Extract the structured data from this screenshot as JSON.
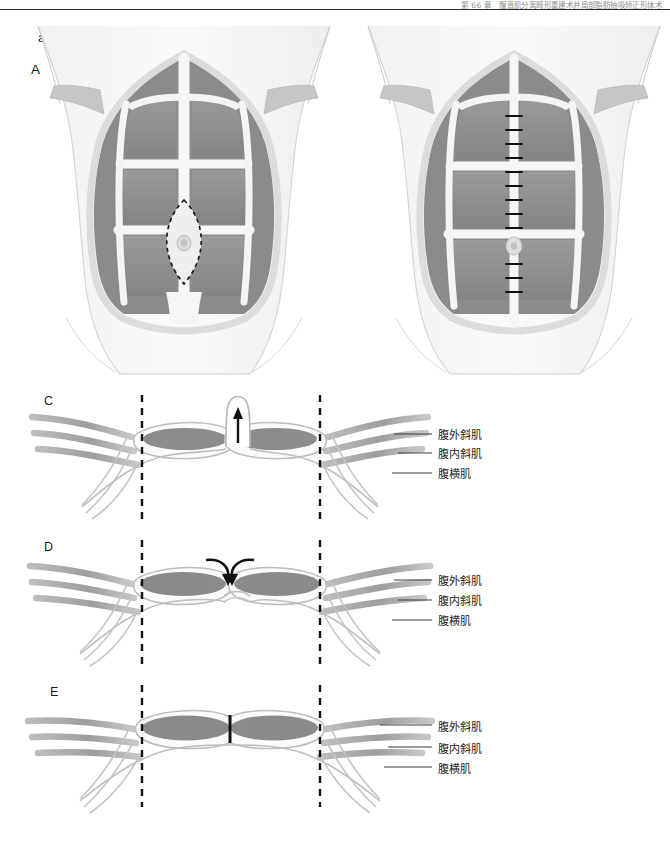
{
  "page": {
    "running_head": "第 66 章　腹直肌分离畸形重建术并局部脂肪抽吸矫正形体术",
    "width": 670,
    "height": 845
  },
  "figure": {
    "figure_label": "a",
    "panels": [
      {
        "id": "A",
        "label": "A",
        "view": "anterior-abdominal-wall",
        "caption_role": "diastasis-recti-before-repair",
        "features": [
          "rectus-abdominis",
          "linea-alba",
          "tendinous-intersections",
          "umbilicus",
          "dashed-defect-outline",
          "costal-margin",
          "iliac-crest"
        ]
      },
      {
        "id": "B",
        "label": "B",
        "view": "anterior-abdominal-wall",
        "caption_role": "midline-plication-sutures-after-repair",
        "features": [
          "rectus-abdominis",
          "linea-alba",
          "suture-line",
          "umbilicus",
          "costal-margin",
          "iliac-crest"
        ]
      },
      {
        "id": "C",
        "label": "C",
        "view": "axial-cross-section",
        "caption_role": "pre-repair-midline-bulge",
        "features": [
          "rectus-abdominis",
          "bulge",
          "up-arrow",
          "dashed-semilunar-lines"
        ]
      },
      {
        "id": "D",
        "label": "D",
        "view": "axial-cross-section",
        "caption_role": "medial-advancement-of-rectus-muscles",
        "features": [
          "rectus-abdominis",
          "curved-arrows",
          "dashed-semilunar-lines"
        ]
      },
      {
        "id": "E",
        "label": "E",
        "view": "axial-cross-section",
        "caption_role": "post-repair-approximated-midline",
        "features": [
          "rectus-abdominis",
          "midline-plication",
          "dashed-semilunar-lines"
        ]
      }
    ],
    "muscle_layer_labels": [
      {
        "text": "腹外斜肌",
        "meaning": "external-oblique"
      },
      {
        "text": "腹内斜肌",
        "meaning": "internal-oblique"
      },
      {
        "text": "腹横肌",
        "meaning": "transversus-abdominis"
      }
    ],
    "colors": {
      "muscle_fill": "#8e8e8e",
      "muscle_fill_dark": "#7c7c7c",
      "fascia": "#d8d8d8",
      "skin_outline": "#c9c9c9",
      "dashed_line": "#1c1c1c",
      "leader_line": "#3a3a3a",
      "rule": "#2b2b2b",
      "background": "#ffffff"
    }
  }
}
